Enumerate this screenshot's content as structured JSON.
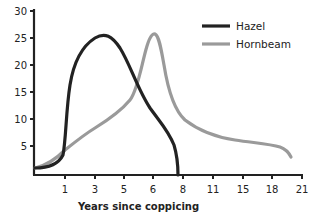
{
  "chart_data": {
    "type": "line",
    "title": "",
    "xlabel": "Years since coppicing",
    "ylabel": "",
    "x_tick_labels": [
      "1",
      "3",
      "5",
      "6",
      "8",
      "11",
      "15",
      "18",
      "21"
    ],
    "y_tick_labels": [
      "5",
      "10",
      "15",
      "20",
      "25",
      "30"
    ],
    "ylim": [
      0,
      30
    ],
    "grid": false,
    "legend_position": "upper right",
    "series": [
      {
        "name": "Hazel",
        "color": "#222222",
        "points": [
          [
            0,
            1.5
          ],
          [
            0.5,
            2.5
          ],
          [
            0.9,
            5
          ],
          [
            1,
            10
          ],
          [
            1.2,
            17
          ],
          [
            2,
            23
          ],
          [
            3,
            25.5
          ],
          [
            4,
            23
          ],
          [
            5,
            17
          ],
          [
            5.5,
            13
          ],
          [
            6,
            10
          ],
          [
            7,
            5.5
          ],
          [
            7.7,
            0
          ]
        ]
      },
      {
        "name": "Hornbeam",
        "color": "#999999",
        "points": [
          [
            0,
            1.5
          ],
          [
            1,
            5
          ],
          [
            2,
            8.5
          ],
          [
            3,
            11
          ],
          [
            4,
            14
          ],
          [
            5,
            18
          ],
          [
            5.5,
            23
          ],
          [
            6,
            26
          ],
          [
            6.5,
            24
          ],
          [
            7,
            17
          ],
          [
            8,
            10
          ],
          [
            11,
            7
          ],
          [
            15,
            6
          ],
          [
            18,
            5
          ],
          [
            20,
            3.5
          ]
        ]
      }
    ]
  },
  "axes": {
    "y_ticks": [
      {
        "label": "30",
        "y": 11
      },
      {
        "label": "25",
        "y": 38
      },
      {
        "label": "20",
        "y": 65
      },
      {
        "label": "15",
        "y": 92
      },
      {
        "label": "10",
        "y": 119
      },
      {
        "label": "5",
        "y": 146
      }
    ],
    "x_ticks": [
      {
        "label": "1",
        "x": 65
      },
      {
        "label": "3",
        "x": 95
      },
      {
        "label": "5",
        "x": 124
      },
      {
        "label": "6",
        "x": 153
      },
      {
        "label": "8",
        "x": 183
      },
      {
        "label": "11",
        "x": 213
      },
      {
        "label": "15",
        "x": 243
      },
      {
        "label": "18",
        "x": 272
      },
      {
        "label": "21",
        "x": 302
      }
    ],
    "xlabel": "Years since coppicing"
  },
  "legend": {
    "items": [
      {
        "label": "Hazel",
        "color": "#222222"
      },
      {
        "label": "Hornbeam",
        "color": "#999999"
      }
    ]
  }
}
